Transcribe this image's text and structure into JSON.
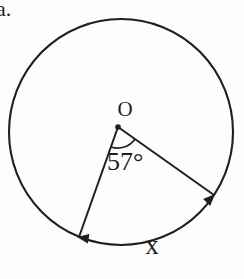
{
  "figure": {
    "problem_label": "a.",
    "center_label": "O",
    "angle_label": "57°",
    "angle_degrees": 57,
    "arc_label": "x"
  },
  "colors": {
    "ink": "#1f1f1f",
    "background": "#fdfdfc"
  }
}
